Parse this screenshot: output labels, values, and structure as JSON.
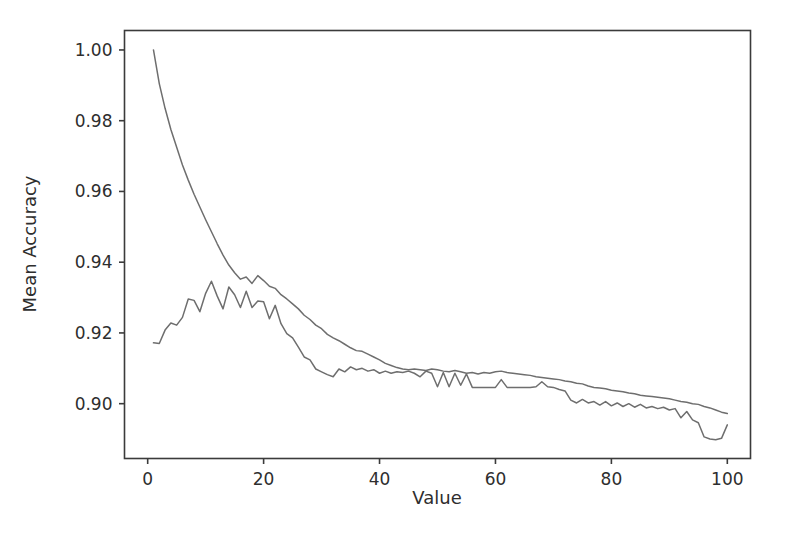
{
  "chart_data": {
    "type": "line",
    "title": "",
    "subtitle": "",
    "xlabel": "Value",
    "ylabel": "Mean Accuracy",
    "xlim": [
      -4,
      104
    ],
    "ylim": [
      0.8845,
      1.0055
    ],
    "xticks": [
      0,
      20,
      40,
      60,
      80,
      100
    ],
    "xtick_labels": [
      "0",
      "20",
      "40",
      "60",
      "80",
      "100"
    ],
    "yticks": [
      0.9,
      0.92,
      0.94,
      0.96,
      0.98,
      1.0
    ],
    "ytick_labels": [
      "0.90",
      "0.92",
      "0.94",
      "0.96",
      "0.98",
      "1.00"
    ],
    "grid": false,
    "legend": null,
    "legend_position": "none",
    "annotations": [],
    "colors": {
      "series_a": "#6e6e6e",
      "series_b": "#6e6e6e",
      "axis": "#3b3b3b",
      "text": "#2e2e2e",
      "background": "#ffffff"
    },
    "x": [
      1,
      2,
      3,
      4,
      5,
      6,
      7,
      8,
      9,
      10,
      11,
      12,
      13,
      14,
      15,
      16,
      17,
      18,
      19,
      20,
      21,
      22,
      23,
      24,
      25,
      26,
      27,
      28,
      29,
      30,
      31,
      32,
      33,
      34,
      35,
      36,
      37,
      38,
      39,
      40,
      41,
      42,
      43,
      44,
      45,
      46,
      47,
      48,
      49,
      50,
      51,
      52,
      53,
      54,
      55,
      56,
      57,
      58,
      59,
      60,
      61,
      62,
      63,
      64,
      65,
      66,
      67,
      68,
      69,
      70,
      71,
      72,
      73,
      74,
      75,
      76,
      77,
      78,
      79,
      80,
      81,
      82,
      83,
      84,
      85,
      86,
      87,
      88,
      89,
      90,
      91,
      92,
      93,
      94,
      95,
      96,
      97,
      98,
      99,
      100
    ],
    "series": [
      {
        "name": "series_a",
        "color": "#6e6e6e",
        "values": [
          1.0,
          0.9905,
          0.9835,
          0.9775,
          0.9725,
          0.9675,
          0.9632,
          0.9592,
          0.9556,
          0.952,
          0.9486,
          0.9452,
          0.942,
          0.9392,
          0.937,
          0.9352,
          0.9358,
          0.934,
          0.9362,
          0.9348,
          0.9332,
          0.9326,
          0.9308,
          0.9296,
          0.9282,
          0.9268,
          0.925,
          0.9238,
          0.9222,
          0.9212,
          0.9196,
          0.9186,
          0.9178,
          0.9168,
          0.9158,
          0.915,
          0.9148,
          0.914,
          0.9132,
          0.9124,
          0.9114,
          0.9108,
          0.9102,
          0.9098,
          0.9096,
          0.9098,
          0.9096,
          0.9094,
          0.9098,
          0.9096,
          0.9092,
          0.909,
          0.9094,
          0.909,
          0.9086,
          0.9088,
          0.9084,
          0.9088,
          0.9086,
          0.909,
          0.9092,
          0.9088,
          0.9086,
          0.9084,
          0.9082,
          0.908,
          0.9076,
          0.9074,
          0.9072,
          0.907,
          0.9068,
          0.9064,
          0.9062,
          0.9058,
          0.9056,
          0.905,
          0.9046,
          0.9044,
          0.9042,
          0.9038,
          0.9036,
          0.9034,
          0.903,
          0.9028,
          0.9024,
          0.9022,
          0.902,
          0.9018,
          0.9016,
          0.9014,
          0.901,
          0.9006,
          0.9004,
          0.9,
          0.8998,
          0.8992,
          0.8988,
          0.8982,
          0.8976,
          0.8972
        ]
      },
      {
        "name": "series_b",
        "color": "#6e6e6e",
        "values": [
          0.9172,
          0.917,
          0.9208,
          0.9228,
          0.9222,
          0.9244,
          0.9296,
          0.9292,
          0.926,
          0.9312,
          0.9346,
          0.9304,
          0.9268,
          0.933,
          0.9308,
          0.9272,
          0.9318,
          0.9272,
          0.929,
          0.9288,
          0.924,
          0.9278,
          0.9226,
          0.9198,
          0.9186,
          0.916,
          0.9132,
          0.9124,
          0.9098,
          0.909,
          0.9082,
          0.9076,
          0.9098,
          0.909,
          0.9104,
          0.9096,
          0.91,
          0.9092,
          0.9096,
          0.9086,
          0.9092,
          0.9086,
          0.909,
          0.9088,
          0.9092,
          0.9086,
          0.9076,
          0.9092,
          0.9086,
          0.9048,
          0.9088,
          0.9048,
          0.9086,
          0.9052,
          0.9084,
          0.9046,
          0.9046,
          0.9046,
          0.9046,
          0.9046,
          0.9068,
          0.9046,
          0.9046,
          0.9046,
          0.9046,
          0.9046,
          0.9048,
          0.9062,
          0.9048,
          0.9046,
          0.904,
          0.9036,
          0.901,
          0.9002,
          0.9012,
          0.9002,
          0.9006,
          0.8996,
          0.9006,
          0.8994,
          0.9002,
          0.8992,
          0.9,
          0.899,
          0.8998,
          0.8988,
          0.8992,
          0.8986,
          0.899,
          0.8982,
          0.8986,
          0.896,
          0.8978,
          0.8954,
          0.8946,
          0.8906,
          0.89,
          0.8898,
          0.8902,
          0.894
        ]
      }
    ]
  }
}
